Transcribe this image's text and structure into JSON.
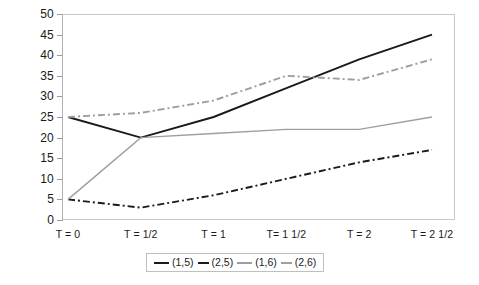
{
  "chart_data": {
    "type": "line",
    "title": "",
    "subtitle": "",
    "xlabel": "",
    "ylabel": "",
    "grid": false,
    "legend_position": "bottom",
    "ylim": [
      0,
      50
    ],
    "ytick_labels": [
      "50",
      "45",
      "40",
      "35",
      "30",
      "25",
      "20",
      "15",
      "10",
      "5",
      "0"
    ],
    "ytick_values": [
      50,
      45,
      40,
      35,
      30,
      25,
      20,
      15,
      10,
      5,
      0
    ],
    "categories": [
      "T = 0",
      "T = 1/2",
      "T = 1",
      "T= 1 1/2",
      "T = 2",
      "T = 2 1/2"
    ],
    "series": [
      {
        "name": "(1,5)",
        "values": [
          25,
          20,
          25,
          32,
          39,
          45
        ],
        "color": "#1a1a1a",
        "style": "solid",
        "width": 1.9
      },
      {
        "name": "(2,5)",
        "values": [
          5,
          3,
          6,
          10,
          14,
          17
        ],
        "color": "#1a1a1a",
        "style": "dashdot",
        "width": 1.9
      },
      {
        "name": "(1,6)",
        "values": [
          5,
          20,
          21,
          22,
          22,
          25
        ],
        "color": "#9e9e9e",
        "style": "solid",
        "width": 1.4
      },
      {
        "name": "(2,6)",
        "values": [
          25,
          26,
          29,
          35,
          34,
          39
        ],
        "color": "#9e9e9e",
        "style": "dashdot",
        "width": 1.9
      }
    ]
  },
  "legend": {
    "items": [
      {
        "label": "(1,5)",
        "color": "#1a1a1a",
        "style": "solid"
      },
      {
        "label": "(2,5)",
        "color": "#1a1a1a",
        "style": "dashdot"
      },
      {
        "label": "(1,6)",
        "color": "#9e9e9e",
        "style": "solid"
      },
      {
        "label": "(2,6)",
        "color": "#9e9e9e",
        "style": "dashdot"
      }
    ]
  },
  "colors": {
    "dark_series": "#1a1a1a",
    "light_series": "#9e9e9e",
    "axis": "#b0b0b0",
    "frame": "#c9c9c9",
    "background": "#ffffff"
  }
}
